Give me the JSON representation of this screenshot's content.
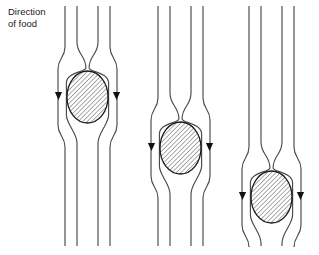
{
  "figure": {
    "background_color": "#ffffff",
    "width": 319,
    "height": 255,
    "caption": {
      "line1": "Direction",
      "line2": "of food",
      "full_text": "Direction of food",
      "x": 8,
      "y": 15,
      "color": "#1a1a1a",
      "font_size": 9.5
    },
    "style": {
      "line_color": "#4a4a4a",
      "line_width": 1.15,
      "bolus_outline_color": "#1a1a1a",
      "bolus_fill": "#ffffff",
      "hatch_color": "#3a3a3a",
      "arrow_color": "#111111",
      "hatch_angle_deg": 45,
      "hatch_spacing": 3.2
    },
    "panels": [
      {
        "id": "panel-1",
        "label": "stage-1-bolus-upper",
        "center_x": 87.5,
        "tube_top": 6,
        "tube_bottom": 246,
        "outer_left_x": 65.0,
        "inner_left_x": 77.0,
        "inner_right_x": 98.0,
        "outer_right_x": 110.0,
        "bolus": {
          "cx": 87.5,
          "cy": 97,
          "rx": 20.5,
          "ry": 26.0,
          "top_y": 71,
          "bottom_y": 123
        },
        "neck_y": 68,
        "arrows": [
          {
            "name": "left-flow-arrow",
            "x": 58.5,
            "y": 96,
            "direction": "down"
          },
          {
            "name": "right-flow-arrow",
            "x": 116.5,
            "y": 96,
            "direction": "down"
          }
        ]
      },
      {
        "id": "panel-2",
        "label": "stage-2-bolus-middle",
        "center_x": 180.5,
        "tube_top": 6,
        "tube_bottom": 246,
        "outer_left_x": 158.0,
        "inner_left_x": 170.0,
        "inner_right_x": 191.0,
        "outer_right_x": 203.0,
        "bolus": {
          "cx": 180.5,
          "cy": 148,
          "rx": 20.5,
          "ry": 26.0,
          "top_y": 122,
          "bottom_y": 174
        },
        "neck_y": 119,
        "arrows": [
          {
            "name": "left-flow-arrow",
            "x": 151.5,
            "y": 147,
            "direction": "down"
          },
          {
            "name": "right-flow-arrow",
            "x": 209.5,
            "y": 147,
            "direction": "down"
          }
        ]
      },
      {
        "id": "panel-3",
        "label": "stage-3-bolus-lower",
        "center_x": 271.5,
        "tube_top": 6,
        "tube_bottom": 246,
        "outer_left_x": 249.0,
        "inner_left_x": 261.0,
        "inner_right_x": 282.0,
        "outer_right_x": 294.0,
        "bolus": {
          "cx": 271.5,
          "cy": 197,
          "rx": 20.5,
          "ry": 26.0,
          "top_y": 171,
          "bottom_y": 223
        },
        "neck_y": 168,
        "arrows": [
          {
            "name": "left-flow-arrow",
            "x": 242.5,
            "y": 196,
            "direction": "down"
          },
          {
            "name": "right-flow-arrow",
            "x": 300.5,
            "y": 196,
            "direction": "down"
          }
        ]
      }
    ]
  }
}
